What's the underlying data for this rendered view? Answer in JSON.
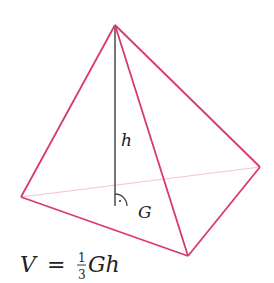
{
  "diagram": {
    "type": "pyramid-volume",
    "colors": {
      "edge": "#d93a6a",
      "hidden_edge": "#f2c4d2",
      "height_line": "#555555",
      "text": "#222222"
    },
    "vertices": {
      "apex": [
        115,
        25
      ],
      "left": [
        21,
        197
      ],
      "right": [
        260,
        167
      ],
      "front": [
        188,
        256
      ],
      "foot": [
        115,
        206
      ]
    },
    "labels": {
      "height": "h",
      "base_area": "G",
      "formula_lhs": "V",
      "formula_eq": "=",
      "formula_num": "1",
      "formula_den": "3",
      "formula_rhs": "Gh"
    }
  }
}
